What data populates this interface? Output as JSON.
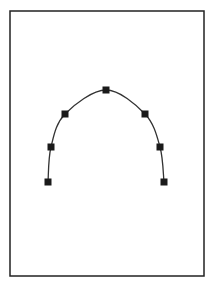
{
  "diagram": {
    "frame": {
      "x": 10,
      "y": 11,
      "width": 194,
      "height": 265,
      "stroke": "#222222"
    },
    "curve": {
      "stroke": "#333333",
      "control_points": [
        {
          "x": 48,
          "y": 182
        },
        {
          "x": 51,
          "y": 147
        },
        {
          "x": 65,
          "y": 114
        },
        {
          "x": 106,
          "y": 90
        },
        {
          "x": 145,
          "y": 114
        },
        {
          "x": 160,
          "y": 147
        },
        {
          "x": 164,
          "y": 182
        }
      ],
      "marker_color": "#1a1a1a",
      "marker_size": 7
    }
  }
}
